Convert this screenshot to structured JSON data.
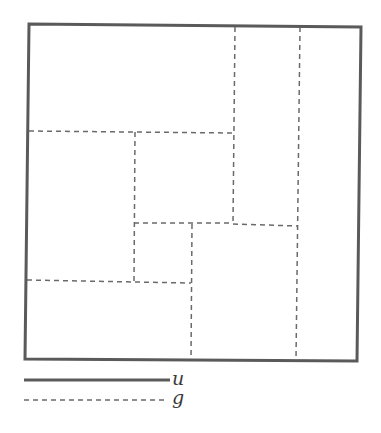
{
  "diagram": {
    "title": "",
    "colors": {
      "frame": "#5a5a5a",
      "partition": "#6a6a6a",
      "text": "#3a3a3a",
      "background": "#ffffff"
    },
    "outer_boundary": {
      "label": "u",
      "style": "solid",
      "corners": [
        [
          29,
          24
        ],
        [
          361,
          27
        ],
        [
          357,
          361
        ],
        [
          25,
          359
        ]
      ]
    },
    "partition_lines": {
      "label": "g",
      "style": "dashed",
      "segments": [
        {
          "id": "v-right",
          "x1": 300,
          "y1": 27,
          "x2": 296,
          "y2": 360
        },
        {
          "id": "v-upper-mid",
          "x1": 235,
          "y1": 27,
          "x2": 233,
          "y2": 223
        },
        {
          "id": "h-upper",
          "x1": 29,
          "y1": 131,
          "x2": 233,
          "y2": 133
        },
        {
          "id": "v-center-left",
          "x1": 135,
          "y1": 132,
          "x2": 134,
          "y2": 281
        },
        {
          "id": "h-middle-left",
          "x1": 134,
          "y1": 223,
          "x2": 233,
          "y2": 223
        },
        {
          "id": "h-middle-right",
          "x1": 233,
          "y1": 224,
          "x2": 298,
          "y2": 226
        },
        {
          "id": "v-lower-mid",
          "x1": 192,
          "y1": 224,
          "x2": 191,
          "y2": 360
        },
        {
          "id": "h-lower",
          "x1": 27,
          "y1": 280,
          "x2": 191,
          "y2": 283
        }
      ]
    },
    "regions": [
      "top-left large block",
      "upper-middle column block",
      "right strip",
      "center block",
      "left middle block",
      "small center-lower block",
      "lower right block",
      "bottom-left block"
    ]
  },
  "legend": {
    "items": [
      {
        "label": "u",
        "style": "solid",
        "x1": 24,
        "x2": 170,
        "y": 380
      },
      {
        "label": "g",
        "style": "dashed",
        "x1": 24,
        "x2": 168,
        "y": 400
      }
    ]
  }
}
